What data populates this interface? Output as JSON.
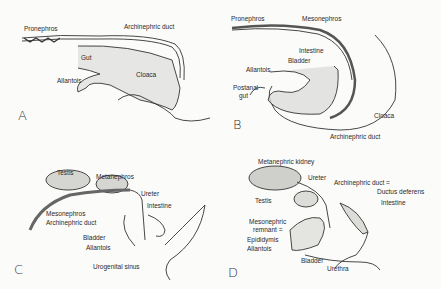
{
  "figure": {
    "panels": [
      {
        "id": "A",
        "labels": [
          "Pronephros",
          "Archinephric duct",
          "Gut",
          "Allantois",
          "Cloaca"
        ]
      },
      {
        "id": "B",
        "labels": [
          "Pronephros",
          "Mesonephros",
          "Intestine",
          "Bladder",
          "Allantois",
          "Postanal",
          "gut",
          "Cloaca",
          "Archinephric duct"
        ]
      },
      {
        "id": "C",
        "labels": [
          "Testis",
          "Metanephros",
          "Ureter",
          "Intestine",
          "Mesonephros",
          "Archinephric duct",
          "Bladder",
          "Allantois",
          "Urogenital sinus"
        ]
      },
      {
        "id": "D",
        "labels": [
          "Metanephric kidney",
          "Ureter",
          "Archinephric duct =",
          "Ductus deferens",
          "Testis",
          "Intestine",
          "Mesonephric",
          "remnant =",
          "Epididymis",
          "Allantois",
          "Bladder",
          "Urethra"
        ]
      }
    ]
  }
}
